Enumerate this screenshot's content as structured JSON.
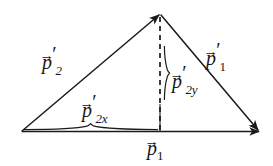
{
  "figure": {
    "background_color": "#ffffff",
    "stroke_color": "#1a1a1a"
  },
  "labels": {
    "p2_prime": {
      "base": "p",
      "prime": "′",
      "subscript": "2",
      "arrow": "→"
    },
    "p1_prime": {
      "base": "p",
      "prime": "′",
      "subscript": "1",
      "arrow": "→"
    },
    "p2_prime_y": {
      "base": "p",
      "prime": "′",
      "subscript": "2y",
      "arrow": "→"
    },
    "p2_prime_x": {
      "base": "p",
      "prime": "′",
      "subscript": "2x",
      "arrow": "→"
    },
    "p1": {
      "base": "p",
      "prime": "",
      "subscript": "1",
      "arrow": "→"
    }
  },
  "geometry": {
    "origin_vertex": {
      "x": 22,
      "y": 131
    },
    "apex_vertex": {
      "x": 160,
      "y": 14
    },
    "right_vertex": {
      "x": 259,
      "y": 131
    },
    "foot_of_perpendicular": {
      "x": 160,
      "y": 131
    },
    "vectors": [
      {
        "name": "p2-prime",
        "from": "origin_vertex",
        "to": "apex_vertex",
        "style": "solid",
        "arrowhead": "end"
      },
      {
        "name": "p1-prime",
        "from": "apex_vertex",
        "to": "right_vertex",
        "style": "solid",
        "arrowhead": "end"
      },
      {
        "name": "p1",
        "from": "origin_vertex",
        "to": "right_vertex",
        "style": "solid",
        "arrowhead": "end"
      },
      {
        "name": "p2-prime-y",
        "from": "apex_vertex",
        "to": "foot_of_perpendicular",
        "style": "dashed",
        "arrowhead": "none"
      }
    ],
    "braces": [
      {
        "name": "brace-p2x",
        "orientation": "horizontal",
        "from_x": 24,
        "to_x": 158,
        "y": 126
      },
      {
        "name": "brace-p2y",
        "orientation": "vertical",
        "from_y": 45,
        "to_y": 101,
        "x": 166
      }
    ]
  }
}
